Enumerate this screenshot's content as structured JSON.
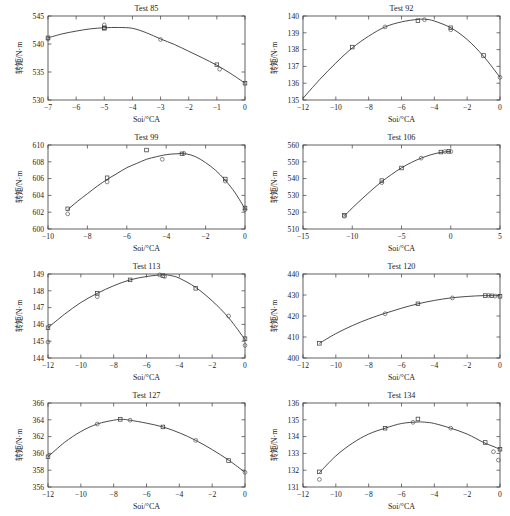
{
  "figure": {
    "axis_label_x": "Soi/°CA",
    "axis_label_y": "转矩/N·m",
    "panel_count": 8
  },
  "chart_data": [
    {
      "type": "scatter",
      "title": "Test 85",
      "xlabel": "Soi/°CA",
      "ylabel": "转矩/N·m",
      "xlim": [
        -7,
        0
      ],
      "ylim": [
        530,
        545
      ],
      "xticks": [
        -7,
        -6,
        -5,
        -4,
        -3,
        -2,
        -1,
        0
      ],
      "xticklabels": [
        "−7",
        "−6",
        "−5",
        "−4",
        "−3",
        "−2",
        "−1",
        "0"
      ],
      "yticks": [
        530,
        535,
        540,
        545
      ],
      "yticklabels": [
        "530",
        "535",
        "540",
        "545"
      ],
      "grid": false,
      "legend": "none",
      "points": [
        {
          "x": -7,
          "y": 541.1
        },
        {
          "x": -7,
          "y": 540.9
        },
        {
          "x": -5,
          "y": 542.9
        },
        {
          "x": -5,
          "y": 543.4
        },
        {
          "x": -5,
          "y": 542.8
        },
        {
          "x": -3,
          "y": 540.8
        },
        {
          "x": -1,
          "y": 536.3
        },
        {
          "x": -0.9,
          "y": 535.5
        },
        {
          "x": 0,
          "y": 533.0
        }
      ],
      "fit": [
        {
          "x": -7,
          "y": 541.1
        },
        {
          "x": -6.5,
          "y": 541.8
        },
        {
          "x": -6,
          "y": 542.3
        },
        {
          "x": -5.5,
          "y": 542.7
        },
        {
          "x": -5,
          "y": 542.9
        },
        {
          "x": -4.5,
          "y": 542.95
        },
        {
          "x": -4,
          "y": 542.8
        },
        {
          "x": -3.5,
          "y": 542.0
        },
        {
          "x": -3,
          "y": 540.9
        },
        {
          "x": -2.5,
          "y": 539.9
        },
        {
          "x": -2,
          "y": 538.7
        },
        {
          "x": -1.5,
          "y": 537.5
        },
        {
          "x": -1,
          "y": 536.2
        },
        {
          "x": -0.5,
          "y": 534.7
        },
        {
          "x": 0,
          "y": 533.0
        }
      ]
    },
    {
      "type": "scatter",
      "title": "Test 92",
      "xlabel": "Soi/°CA",
      "ylabel": "转矩/N·m",
      "xlim": [
        -12,
        0
      ],
      "ylim": [
        135,
        140
      ],
      "xticks": [
        -12,
        -10,
        -8,
        -6,
        -4,
        -2,
        0
      ],
      "xticklabels": [
        "−12",
        "−10",
        "−8",
        "−6",
        "−4",
        "−2",
        "0"
      ],
      "yticks": [
        135,
        136,
        137,
        138,
        139,
        140
      ],
      "yticklabels": [
        "135",
        "136",
        "137",
        "138",
        "139",
        "140"
      ],
      "grid": false,
      "legend": "none",
      "points": [
        {
          "x": -9,
          "y": 138.15
        },
        {
          "x": -7,
          "y": 139.35
        },
        {
          "x": -5,
          "y": 139.72
        },
        {
          "x": -4.6,
          "y": 139.78
        },
        {
          "x": -3,
          "y": 139.3
        },
        {
          "x": -3,
          "y": 139.18
        },
        {
          "x": -1,
          "y": 137.65
        },
        {
          "x": 0,
          "y": 136.35
        }
      ],
      "fit": [
        {
          "x": -12,
          "y": 135.1
        },
        {
          "x": -11,
          "y": 136.2
        },
        {
          "x": -10,
          "y": 137.2
        },
        {
          "x": -9,
          "y": 138.1
        },
        {
          "x": -8,
          "y": 138.8
        },
        {
          "x": -7,
          "y": 139.35
        },
        {
          "x": -6,
          "y": 139.65
        },
        {
          "x": -5,
          "y": 139.8
        },
        {
          "x": -4.5,
          "y": 139.8
        },
        {
          "x": -4,
          "y": 139.7
        },
        {
          "x": -3,
          "y": 139.3
        },
        {
          "x": -2,
          "y": 138.6
        },
        {
          "x": -1,
          "y": 137.6
        },
        {
          "x": 0,
          "y": 136.35
        }
      ]
    },
    {
      "type": "scatter",
      "title": "Test 99",
      "xlabel": "Soi/°CA",
      "ylabel": "转矩/N·m",
      "xlim": [
        -10,
        0
      ],
      "ylim": [
        600,
        610
      ],
      "xticks": [
        -10,
        -8,
        -6,
        -4,
        -2,
        0
      ],
      "xticklabels": [
        "−10",
        "−8",
        "−6",
        "−4",
        "−2",
        "0"
      ],
      "yticks": [
        600,
        602,
        604,
        606,
        608,
        610
      ],
      "yticklabels": [
        "600",
        "602",
        "604",
        "606",
        "608",
        "610"
      ],
      "grid": false,
      "legend": "none",
      "points": [
        {
          "x": -9,
          "y": 602.4
        },
        {
          "x": -9,
          "y": 601.8
        },
        {
          "x": -7,
          "y": 606.1
        },
        {
          "x": -7,
          "y": 605.6
        },
        {
          "x": -5,
          "y": 609.4
        },
        {
          "x": -4.2,
          "y": 608.3
        },
        {
          "x": -3.2,
          "y": 608.95
        },
        {
          "x": -3.1,
          "y": 609.0
        },
        {
          "x": -1,
          "y": 605.95
        },
        {
          "x": -1,
          "y": 605.7
        },
        {
          "x": 0,
          "y": 602.5
        },
        {
          "x": 0,
          "y": 602.3
        }
      ],
      "fit": [
        {
          "x": -9,
          "y": 602.3
        },
        {
          "x": -8.5,
          "y": 603.3
        },
        {
          "x": -8,
          "y": 604.2
        },
        {
          "x": -7.5,
          "y": 605.1
        },
        {
          "x": -7,
          "y": 605.9
        },
        {
          "x": -6.5,
          "y": 606.6
        },
        {
          "x": -6,
          "y": 607.3
        },
        {
          "x": -5.5,
          "y": 607.8
        },
        {
          "x": -5,
          "y": 608.3
        },
        {
          "x": -4.5,
          "y": 608.6
        },
        {
          "x": -4,
          "y": 608.85
        },
        {
          "x": -3.5,
          "y": 608.95
        },
        {
          "x": -3,
          "y": 608.95
        },
        {
          "x": -2.5,
          "y": 608.6
        },
        {
          "x": -2,
          "y": 607.9
        },
        {
          "x": -1.5,
          "y": 607.0
        },
        {
          "x": -1,
          "y": 605.8
        },
        {
          "x": -0.5,
          "y": 604.3
        },
        {
          "x": 0,
          "y": 602.4
        }
      ]
    },
    {
      "type": "scatter",
      "title": "Test 106",
      "xlabel": "Soi/°CA",
      "ylabel": "转矩/N·m",
      "xlim": [
        -15,
        5
      ],
      "ylim": [
        510,
        560
      ],
      "xticks": [
        -15,
        -10,
        -5,
        0,
        5
      ],
      "xticklabels": [
        "−15",
        "−10",
        "−5",
        "0",
        "5"
      ],
      "yticks": [
        510,
        520,
        530,
        540,
        550,
        560
      ],
      "yticklabels": [
        "510",
        "520",
        "530",
        "540",
        "550",
        "560"
      ],
      "grid": false,
      "legend": "none",
      "points": [
        {
          "x": -10.8,
          "y": 518.2
        },
        {
          "x": -10.8,
          "y": 517.6
        },
        {
          "x": -7,
          "y": 538.8
        },
        {
          "x": -7,
          "y": 537.6
        },
        {
          "x": -5,
          "y": 546.3
        },
        {
          "x": -3,
          "y": 552.2
        },
        {
          "x": -1,
          "y": 555.8
        },
        {
          "x": -0.6,
          "y": 556.1
        },
        {
          "x": -0.2,
          "y": 556.2
        },
        {
          "x": 0,
          "y": 556.1
        }
      ],
      "fit": [
        {
          "x": -10.8,
          "y": 517.8
        },
        {
          "x": -10,
          "y": 522.5
        },
        {
          "x": -9,
          "y": 528.0
        },
        {
          "x": -8,
          "y": 533.3
        },
        {
          "x": -7,
          "y": 538.2
        },
        {
          "x": -6,
          "y": 542.5
        },
        {
          "x": -5,
          "y": 546.4
        },
        {
          "x": -4,
          "y": 549.6
        },
        {
          "x": -3,
          "y": 552.2
        },
        {
          "x": -2,
          "y": 554.2
        },
        {
          "x": -1,
          "y": 555.6
        },
        {
          "x": 0,
          "y": 556.2
        }
      ]
    },
    {
      "type": "scatter",
      "title": "Test 113",
      "xlabel": "Soi/°CA",
      "ylabel": "转矩/N·m",
      "xlim": [
        -12,
        0
      ],
      "ylim": [
        144,
        149
      ],
      "xticks": [
        -12,
        -10,
        -8,
        -6,
        -4,
        -2,
        0
      ],
      "xticklabels": [
        "−12",
        "−10",
        "−8",
        "−6",
        "−4",
        "−2",
        "0"
      ],
      "yticks": [
        144,
        145,
        146,
        147,
        148,
        149
      ],
      "yticklabels": [
        "144",
        "145",
        "146",
        "147",
        "148",
        "149"
      ],
      "grid": false,
      "legend": "none",
      "points": [
        {
          "x": -12,
          "y": 145.8
        },
        {
          "x": -12,
          "y": 144.95
        },
        {
          "x": -9,
          "y": 147.85
        },
        {
          "x": -9,
          "y": 147.65
        },
        {
          "x": -7,
          "y": 148.65
        },
        {
          "x": -5.2,
          "y": 148.95
        },
        {
          "x": -5,
          "y": 148.9
        },
        {
          "x": -4.9,
          "y": 148.85
        },
        {
          "x": -3,
          "y": 148.15
        },
        {
          "x": -1,
          "y": 146.5
        },
        {
          "x": 0,
          "y": 145.15
        },
        {
          "x": 0,
          "y": 144.75
        }
      ],
      "fit": [
        {
          "x": -12,
          "y": 145.8
        },
        {
          "x": -11,
          "y": 146.6
        },
        {
          "x": -10,
          "y": 147.3
        },
        {
          "x": -9,
          "y": 147.85
        },
        {
          "x": -8,
          "y": 148.3
        },
        {
          "x": -7,
          "y": 148.65
        },
        {
          "x": -6,
          "y": 148.85
        },
        {
          "x": -5,
          "y": 148.95
        },
        {
          "x": -4.5,
          "y": 148.9
        },
        {
          "x": -4,
          "y": 148.75
        },
        {
          "x": -3,
          "y": 148.2
        },
        {
          "x": -2,
          "y": 147.4
        },
        {
          "x": -1,
          "y": 146.4
        },
        {
          "x": 0,
          "y": 145.1
        }
      ]
    },
    {
      "type": "scatter",
      "title": "Test 120",
      "xlabel": "Soi/°CA",
      "ylabel": "转矩/N·m",
      "xlim": [
        -12,
        0
      ],
      "ylim": [
        400,
        440
      ],
      "xticks": [
        -12,
        -10,
        -8,
        -6,
        -4,
        -2,
        0
      ],
      "xticklabels": [
        "−12",
        "−10",
        "−8",
        "−6",
        "−4",
        "−2",
        "0"
      ],
      "yticks": [
        400,
        410,
        420,
        430,
        440
      ],
      "yticklabels": [
        "400",
        "410",
        "420",
        "430",
        "440"
      ],
      "grid": false,
      "legend": "none",
      "points": [
        {
          "x": -11,
          "y": 407.0
        },
        {
          "x": -7,
          "y": 421.1
        },
        {
          "x": -5,
          "y": 425.8
        },
        {
          "x": -2.9,
          "y": 428.6
        },
        {
          "x": -0.9,
          "y": 429.7
        },
        {
          "x": -0.7,
          "y": 429.8
        },
        {
          "x": -0.5,
          "y": 429.6
        },
        {
          "x": -0.3,
          "y": 429.5
        },
        {
          "x": 0,
          "y": 429.4
        }
      ],
      "fit": [
        {
          "x": -11,
          "y": 407.0
        },
        {
          "x": -10,
          "y": 411.6
        },
        {
          "x": -9,
          "y": 415.4
        },
        {
          "x": -8,
          "y": 418.6
        },
        {
          "x": -7,
          "y": 421.3
        },
        {
          "x": -6,
          "y": 423.7
        },
        {
          "x": -5,
          "y": 425.8
        },
        {
          "x": -4,
          "y": 427.4
        },
        {
          "x": -3,
          "y": 428.6
        },
        {
          "x": -2,
          "y": 429.3
        },
        {
          "x": -1,
          "y": 429.7
        },
        {
          "x": 0,
          "y": 429.6
        }
      ]
    },
    {
      "type": "scatter",
      "title": "Test 127",
      "xlabel": "Soi/°CA",
      "ylabel": "转矩/N·m",
      "xlim": [
        -12,
        0
      ],
      "ylim": [
        356,
        366
      ],
      "xticks": [
        -12,
        -10,
        -8,
        -6,
        -4,
        -2,
        0
      ],
      "xticklabels": [
        "−12",
        "−10",
        "−8",
        "−6",
        "−4",
        "−2",
        "0"
      ],
      "yticks": [
        356,
        358,
        360,
        362,
        364,
        366
      ],
      "yticklabels": [
        "356",
        "358",
        "360",
        "362",
        "364",
        "366"
      ],
      "grid": false,
      "legend": "none",
      "points": [
        {
          "x": -12,
          "y": 359.6
        },
        {
          "x": -9,
          "y": 363.5
        },
        {
          "x": -7.6,
          "y": 364.05
        },
        {
          "x": -7,
          "y": 363.95
        },
        {
          "x": -5,
          "y": 363.15
        },
        {
          "x": -3,
          "y": 361.55
        },
        {
          "x": -1,
          "y": 359.15
        },
        {
          "x": 0,
          "y": 357.75
        }
      ],
      "fit": [
        {
          "x": -12,
          "y": 359.6
        },
        {
          "x": -11,
          "y": 361.3
        },
        {
          "x": -10,
          "y": 362.6
        },
        {
          "x": -9,
          "y": 363.5
        },
        {
          "x": -8,
          "y": 363.95
        },
        {
          "x": -7.5,
          "y": 364.05
        },
        {
          "x": -7,
          "y": 363.95
        },
        {
          "x": -6,
          "y": 363.6
        },
        {
          "x": -5,
          "y": 363.15
        },
        {
          "x": -4,
          "y": 362.45
        },
        {
          "x": -3,
          "y": 361.55
        },
        {
          "x": -2,
          "y": 360.45
        },
        {
          "x": -1,
          "y": 359.2
        },
        {
          "x": 0,
          "y": 357.75
        }
      ]
    },
    {
      "type": "scatter",
      "title": "Test 134",
      "xlabel": "Soi/°CA",
      "ylabel": "转矩/N·m",
      "xlim": [
        -12,
        0
      ],
      "ylim": [
        131,
        136
      ],
      "xticks": [
        -12,
        -10,
        -8,
        -6,
        -4,
        -2,
        0
      ],
      "xticklabels": [
        "−12",
        "−10",
        "−8",
        "−6",
        "−4",
        "−2",
        "0"
      ],
      "yticks": [
        131,
        132,
        133,
        134,
        135,
        136
      ],
      "yticklabels": [
        "131",
        "132",
        "133",
        "134",
        "135",
        "136"
      ],
      "grid": false,
      "legend": "none",
      "points": [
        {
          "x": -11,
          "y": 131.9
        },
        {
          "x": -11,
          "y": 131.45
        },
        {
          "x": -7,
          "y": 134.5
        },
        {
          "x": -5.3,
          "y": 134.85
        },
        {
          "x": -5,
          "y": 135.05
        },
        {
          "x": -3,
          "y": 134.5
        },
        {
          "x": -0.9,
          "y": 133.65
        },
        {
          "x": -0.4,
          "y": 133.1
        },
        {
          "x": 0,
          "y": 133.25
        },
        {
          "x": -0.1,
          "y": 132.6
        }
      ],
      "fit": [
        {
          "x": -11,
          "y": 131.85
        },
        {
          "x": -10,
          "y": 132.85
        },
        {
          "x": -9,
          "y": 133.6
        },
        {
          "x": -8,
          "y": 134.15
        },
        {
          "x": -7,
          "y": 134.5
        },
        {
          "x": -6,
          "y": 134.78
        },
        {
          "x": -5,
          "y": 134.87
        },
        {
          "x": -4.5,
          "y": 134.85
        },
        {
          "x": -4,
          "y": 134.78
        },
        {
          "x": -3,
          "y": 134.5
        },
        {
          "x": -2,
          "y": 134.15
        },
        {
          "x": -1,
          "y": 133.65
        },
        {
          "x": -0.5,
          "y": 133.45
        },
        {
          "x": 0,
          "y": 133.25
        }
      ]
    }
  ]
}
